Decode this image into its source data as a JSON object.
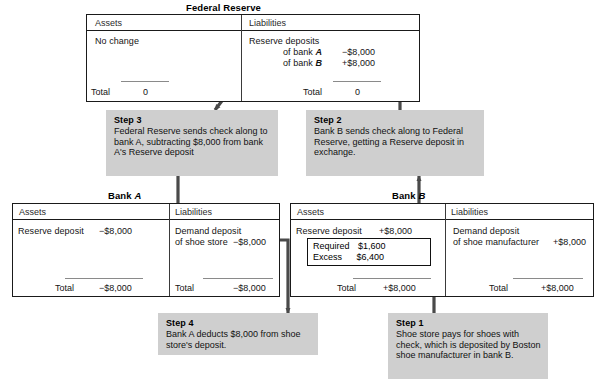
{
  "diagram": {
    "currency_symbol": "$",
    "accent_gray": "#cfcfcf",
    "line_color": "#4a4a4a"
  },
  "fed": {
    "caption": "Federal Reserve",
    "assets_header": "Assets",
    "liabilities_header": "Liabilities",
    "assets_entry": "No change",
    "liabilities_entry": "Reserve deposits",
    "liab_sub_1_label": "of bank",
    "liab_sub_1_bank": "A",
    "liab_sub_1_value": "−$8,000",
    "liab_sub_2_label": "of bank",
    "liab_sub_2_bank": "B",
    "liab_sub_2_value": "+$8,000",
    "assets_total_label": "Total",
    "assets_total_value": "0",
    "liab_total_label": "Total",
    "liab_total_value": "0"
  },
  "bank_a": {
    "caption_prefix": "Bank",
    "caption_bank": "A",
    "assets_header": "Assets",
    "liabilities_header": "Liabilities",
    "assets_entry_label": "Reserve deposit",
    "assets_entry_value": "−$8,000",
    "liab_entry_line1": "Demand deposit",
    "liab_entry_line2": "of shoe store",
    "liab_entry_value": "−$8,000",
    "assets_total_label": "Total",
    "assets_total_value": "−$8,000",
    "liab_total_label": "Total",
    "liab_total_value": "−$8,000"
  },
  "bank_b": {
    "caption_prefix": "Bank",
    "caption_bank": "B",
    "assets_header": "Assets",
    "liabilities_header": "Liabilities",
    "assets_entry_label": "Reserve deposit",
    "assets_entry_value": "+$8,000",
    "reserve_split": {
      "required_label": "Required",
      "required_value": "$1,600",
      "excess_label": "Excess",
      "excess_value": "$6,400"
    },
    "liab_entry_line1": "Demand deposit",
    "liab_entry_line2": "of shoe manufacturer",
    "liab_entry_value": "+$8,000",
    "assets_total_label": "Total",
    "assets_total_value": "+$8,000",
    "liab_total_label": "Total",
    "liab_total_value": "+$8,000"
  },
  "steps": [
    {
      "id": "step1",
      "heading": "Step 1",
      "body": "Shoe store pays for shoes with check, which is deposited by Boston shoe manufacturer in bank B."
    },
    {
      "id": "step2",
      "heading": "Step 2",
      "body": "Bank B sends check along to Federal Reserve, getting a Reserve deposit in exchange."
    },
    {
      "id": "step3",
      "heading": "Step 3",
      "body": "Federal Reserve sends check along to bank A, subtracting $8,000 from bank A's Reserve deposit"
    },
    {
      "id": "step4",
      "heading": "Step 4",
      "body": "Bank A deducts $8,000 from shoe store's deposit."
    }
  ]
}
